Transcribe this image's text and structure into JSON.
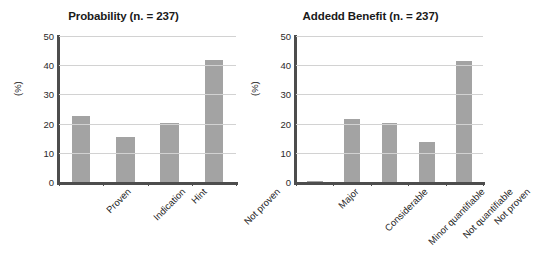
{
  "figure": {
    "background": "#ffffff",
    "bar_color": "#a3a3a3",
    "axis_color": "#4d4d4d",
    "grid_color": "#d2d2d2"
  },
  "chart_data": [
    {
      "type": "bar",
      "title": "Probability (n. = 237)",
      "xlabel": "",
      "ylabel": "(%)",
      "ylim": [
        0,
        50
      ],
      "yticks": [
        0,
        10,
        20,
        30,
        40,
        50
      ],
      "grid": true,
      "legend": "none",
      "categories": [
        "Proven",
        "Indication",
        "Hint",
        "Not proven"
      ],
      "values": [
        22.6,
        15.4,
        20.3,
        41.8
      ]
    },
    {
      "type": "bar",
      "title": "Addedd Benefit (n. = 237)",
      "xlabel": "",
      "ylabel": "(%)",
      "ylim": [
        0,
        50
      ],
      "yticks": [
        0,
        10,
        20,
        30,
        40,
        50
      ],
      "grid": true,
      "legend": "none",
      "categories": [
        "Major",
        "Considerable",
        "Minor quantifiable",
        "Not quantifiable",
        "Not proven"
      ],
      "values": [
        0.4,
        21.5,
        20.3,
        13.7,
        41.5
      ]
    }
  ]
}
